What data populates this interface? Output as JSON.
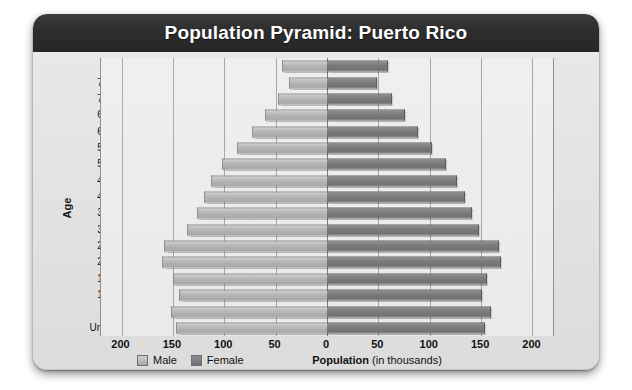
{
  "title": "Population Pyramid: Puerto Rico",
  "axis": {
    "y_title": "Age",
    "x_caption_bold": "Population",
    "x_caption_rest": " (in thousands)"
  },
  "legend": {
    "male_label": "Male",
    "female_label": "Female",
    "male_color": "#b6b6b6",
    "female_color": "#7b7b7b"
  },
  "chart_data": {
    "type": "bar",
    "subtype": "population-pyramid",
    "title": "Population Pyramid: Puerto Rico",
    "xlabel": "Population (in thousands)",
    "ylabel": "Age",
    "xlim": [
      -220,
      220
    ],
    "xticks": [
      200,
      150,
      100,
      50,
      0,
      50,
      100,
      150,
      200
    ],
    "xtick_labels": [
      "200",
      "150",
      "100",
      "50",
      "0",
      "50",
      "100",
      "150",
      "200"
    ],
    "grid": true,
    "legend_position": "bottom-left",
    "categories": [
      "80+",
      "75–79",
      "70–74",
      "65–69",
      "60–64",
      "55–59",
      "50–54",
      "45–49",
      "40–44",
      "35–39",
      "30–34",
      "25–29",
      "20–24",
      "15–19",
      "10–14",
      "5–9",
      "Under 5"
    ],
    "series": [
      {
        "name": "Male",
        "side": "left",
        "values": [
          44,
          37,
          48,
          60,
          73,
          88,
          102,
          113,
          120,
          127,
          136,
          159,
          161,
          150,
          144,
          152,
          147
        ]
      },
      {
        "name": "Female",
        "side": "right",
        "values": [
          58,
          48,
          62,
          75,
          88,
          101,
          115,
          126,
          133,
          140,
          147,
          166,
          168,
          155,
          150,
          159,
          153
        ]
      }
    ]
  }
}
